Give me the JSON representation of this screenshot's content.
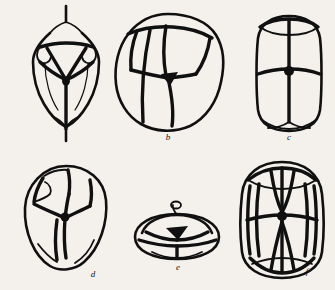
{
  "figure": {
    "kind": "scientific-line-drawing",
    "medium": "ink drawing on paper",
    "background_color": "#f4f1ec",
    "ink_color": "#111010",
    "panel_count": 6,
    "layout": "2 rows x 3 columns",
    "labels": [
      "a",
      "b",
      "c",
      "d",
      "e",
      "f"
    ]
  },
  "panels": [
    {
      "label": "a",
      "row": 1,
      "column": 1,
      "shape": "ovoid with apical and basal spikes",
      "description": "ovoid embryo with a pointed apical projection, central triangular apical cell group, paired lateral cells and a long basal spike",
      "label_x": 66,
      "label_y": 130
    },
    {
      "label": "b",
      "row": 1,
      "column": 2,
      "shape": "rounded polygonal cluster",
      "description": "rounded cluster of large polygonal blastomeres with thick cell walls meeting at a central junction",
      "label_x": 168,
      "label_y": 137
    },
    {
      "label": "c",
      "row": 1,
      "column": 3,
      "shape": "barrel",
      "description": "barrel-shaped embryo divided by a strong equatorial wall into upper and lower tiers, each tier split by vertical walls",
      "label_x": 289,
      "label_y": 136
    },
    {
      "label": "d",
      "row": 2,
      "column": 1,
      "shape": "egg-shaped",
      "description": "egg-shaped embryo with many small peripheral cells around a central triradiate junction",
      "label_x": 93,
      "label_y": 277
    },
    {
      "label": "e",
      "row": 2,
      "column": 2,
      "shape": "flattened disc",
      "description": "flattened disc seen obliquely, with an apical tuft and an equatorial rim of cells",
      "label_x": 178,
      "label_y": 270
    },
    {
      "label": "f",
      "row": 2,
      "column": 3,
      "shape": "elongated barrel",
      "description": "elongated barrel with a ring of narrow lateral cells, an equatorial wall and paired wedge-shaped polar cells",
      "label_x": 307,
      "label_y": 274
    }
  ]
}
